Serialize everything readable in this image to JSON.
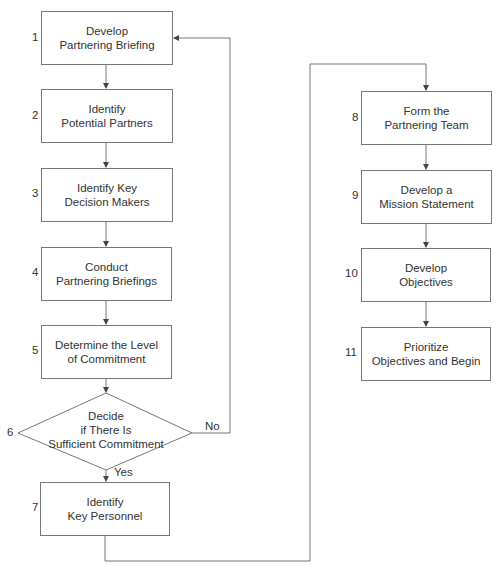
{
  "diagram": {
    "type": "flowchart",
    "steps": [
      {
        "num": "1",
        "label": "Develop\nPartnering Briefing"
      },
      {
        "num": "2",
        "label": "Identify\nPotential Partners"
      },
      {
        "num": "3",
        "label": "Identify Key\nDecision Makers"
      },
      {
        "num": "4",
        "label": "Conduct\nPartnering Briefings"
      },
      {
        "num": "5",
        "label": "Determine the Level\nof Commitment"
      },
      {
        "num": "6",
        "label": "Decide\nif There Is\nSufficient Commitment"
      },
      {
        "num": "7",
        "label": "Identify\nKey Personnel"
      },
      {
        "num": "8",
        "label": "Form the\nPartnering Team"
      },
      {
        "num": "9",
        "label": "Develop a\nMission Statement"
      },
      {
        "num": "10",
        "label": "Develop\nObjectives"
      },
      {
        "num": "11",
        "label": "Prioritize\nObjectives and Begin"
      }
    ],
    "branches": {
      "no": "No",
      "yes": "Yes"
    },
    "colors": {
      "line": "#777777",
      "text": "#333333"
    }
  }
}
